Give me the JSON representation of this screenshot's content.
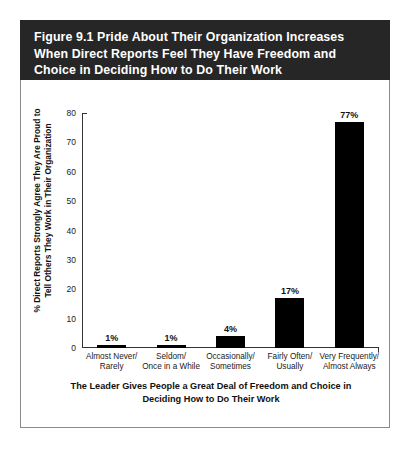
{
  "figure": {
    "title_lines": [
      "Figure 9.1  Pride About Their Organization Increases",
      "When Direct Reports Feel They Have Freedom and",
      "Choice in Deciding How to Do Their Work"
    ],
    "header_bg": "#262626",
    "title_color": "#ffffff"
  },
  "chart_data": {
    "type": "bar",
    "title": "Figure 9.1  Pride About Their Organization Increases When Direct Reports Feel They Have Freedom and Choice in Deciding How to Do Their Work",
    "categories": [
      "Almost Never/ Rarely",
      "Seldom/ Once in a While",
      "Occasionally/ Sometimes",
      "Fairly Often/ Usually",
      "Very Frequently/ Almost Always"
    ],
    "category_lines": [
      [
        "Almost Never/",
        "Rarely"
      ],
      [
        "Seldom/",
        "Once in a While"
      ],
      [
        "Occasionally/",
        "Sometimes"
      ],
      [
        "Fairly Often/",
        "Usually"
      ],
      [
        "Very Frequently/",
        "Almost Always"
      ]
    ],
    "values": [
      1,
      1,
      4,
      17,
      77
    ],
    "value_labels": [
      "1%",
      "1%",
      "4%",
      "17%",
      "77%"
    ],
    "ylabel": "% Direct Reports Strongly Agree They Are Proud to Tell Others They Work in Their Organization",
    "ylabel_lines": [
      "% Direct Reports Strongly Agree They Are Proud to",
      "Tell Others They Work in Their Organization"
    ],
    "xlabel": "The Leader Gives People a Great Deal of Freedom and Choice in Deciding How to Do Their Work",
    "xlabel_lines": [
      "The Leader Gives People a Great Deal of Freedom and Choice in",
      "Deciding How to Do Their Work"
    ],
    "yticks": [
      80,
      70,
      60,
      50,
      40,
      30,
      20,
      10,
      0
    ],
    "ytick_labels": [
      "80",
      "70",
      "60",
      "50",
      "40",
      "30",
      "20",
      "10",
      "0"
    ],
    "ylim": [
      0,
      80
    ],
    "grid": false,
    "legend": null,
    "bar_color": "#000000",
    "axis_color": "#333333"
  }
}
